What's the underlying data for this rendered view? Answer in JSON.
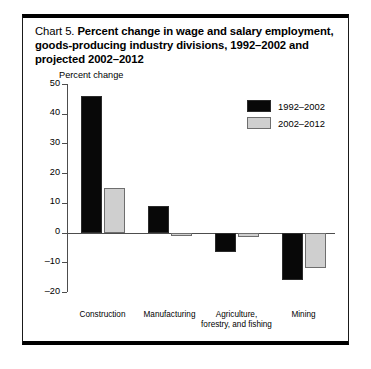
{
  "title": {
    "chart_number": "Chart 5.",
    "text": "Percent change in wage and salary employment, goods-producing industry divisions, 1992–2002 and projected 2002–2012"
  },
  "chart_data": {
    "type": "bar",
    "title": "Chart 5.  Percent change in wage and salary employment, goods-producing industry divisions, 1992–2002 and projected 2002–2012",
    "xlabel": "",
    "ylabel": "Percent change",
    "ylim": [
      -20,
      50
    ],
    "ytick_step": 10,
    "yticks": [
      50,
      40,
      30,
      20,
      10,
      0,
      -10,
      -20
    ],
    "ytick_labels": [
      "50",
      "40",
      "30",
      "20",
      "10",
      "0",
      "–10",
      "–20"
    ],
    "grid": false,
    "legend_position": "top-right",
    "categories": [
      "Construction",
      "Manufacturing",
      "Agriculture,\nforestry, and fishing",
      "Mining"
    ],
    "series": [
      {
        "name": "1992–2002",
        "color": "#080808",
        "values": [
          46,
          9,
          -6.5,
          -16
        ]
      },
      {
        "name": "2002–2012",
        "color": "#cfcfcf",
        "values": [
          15,
          -1,
          -1.5,
          -12
        ]
      }
    ]
  }
}
